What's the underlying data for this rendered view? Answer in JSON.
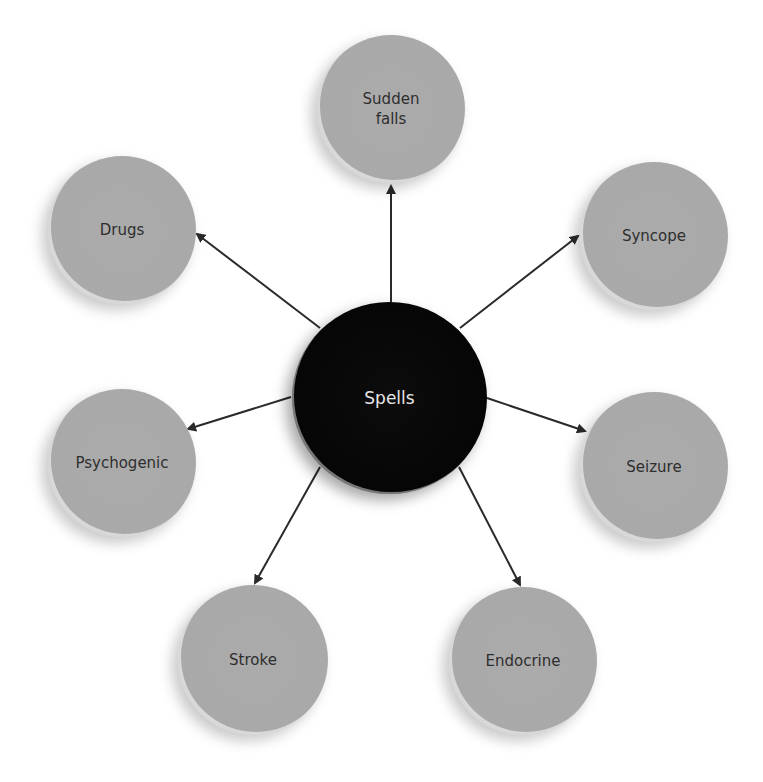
{
  "diagram": {
    "type": "hub-and-spoke",
    "center": {
      "label": "Spells",
      "color": "#080808"
    },
    "nodes": [
      {
        "id": "sudden-falls",
        "label": "Sudden\nfalls"
      },
      {
        "id": "syncope",
        "label": "Syncope"
      },
      {
        "id": "seizure",
        "label": "Seizure"
      },
      {
        "id": "endocrine",
        "label": "Endocrine"
      },
      {
        "id": "stroke",
        "label": "Stroke"
      },
      {
        "id": "psychogenic",
        "label": "Psychogenic"
      },
      {
        "id": "drugs",
        "label": "Drugs"
      }
    ],
    "edges": [
      {
        "from": "Spells",
        "to": "Sudden falls"
      },
      {
        "from": "Spells",
        "to": "Syncope"
      },
      {
        "from": "Spells",
        "to": "Seizure"
      },
      {
        "from": "Spells",
        "to": "Endocrine"
      },
      {
        "from": "Spells",
        "to": "Stroke"
      },
      {
        "from": "Spells",
        "to": "Psychogenic"
      },
      {
        "from": "Spells",
        "to": "Drugs"
      }
    ],
    "colors": {
      "outer_node": "#a9a9a9",
      "center_node": "#080808",
      "arrow": "#2a2a2a",
      "outer_text": "#2e2e2e",
      "center_text": "#e6e6e6"
    }
  }
}
